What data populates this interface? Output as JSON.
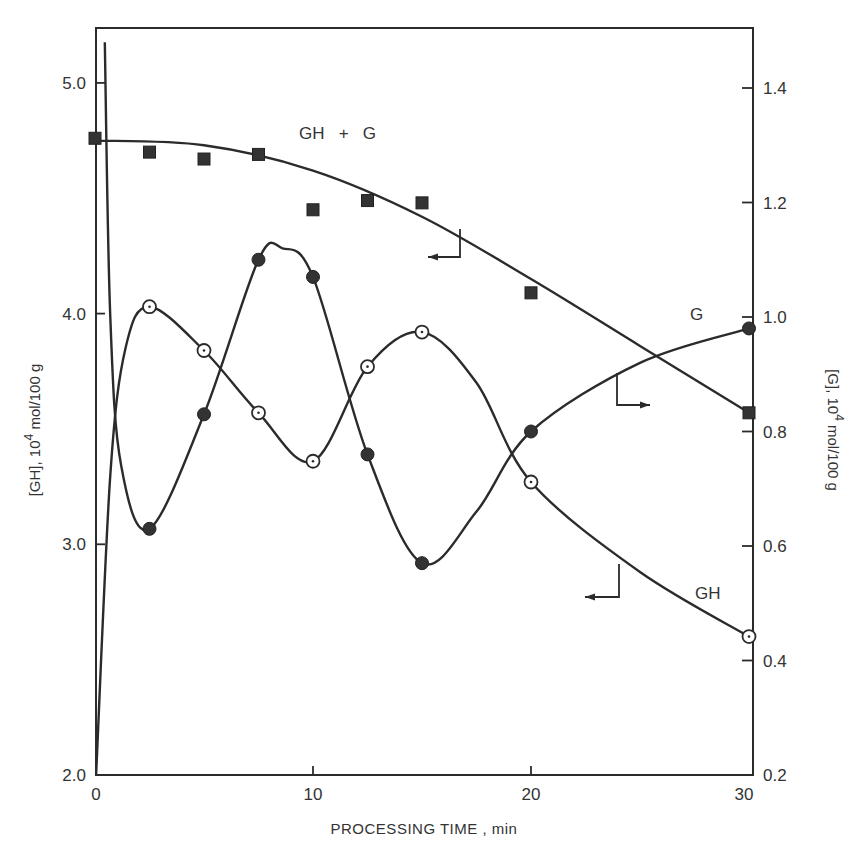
{
  "chart_data": {
    "type": "line",
    "title": "",
    "xlabel": "PROCESSING  TIME , min",
    "ylabel_left": "[GH], 10^4 mol/100 g",
    "ylabel_right": "[G], 10^4 mol/100 g",
    "xlim": [
      0,
      30
    ],
    "ylim_left": [
      2.0,
      5.25
    ],
    "ylim_right": [
      0.2,
      1.5
    ],
    "x_ticks": [
      0,
      10,
      20,
      30
    ],
    "y_ticks_left": [
      "2.0",
      "3.0",
      "4.0",
      "5.0"
    ],
    "y_ticks_right": [
      "0.2",
      "0.4",
      "0.6",
      "0.8",
      "1.0",
      "1.2",
      "1.4"
    ],
    "grid": false,
    "legend": "inline labels",
    "series": [
      {
        "name": "GH + G",
        "axis": "left",
        "marker": "filled-square",
        "x": [
          0,
          2.5,
          5,
          7.5,
          10,
          12.5,
          15,
          20,
          30
        ],
        "values": [
          4.76,
          4.7,
          4.67,
          4.69,
          4.45,
          4.49,
          4.48,
          4.09,
          3.57
        ],
        "curve": [
          [
            0,
            4.75
          ],
          [
            5,
            4.73
          ],
          [
            10,
            4.62
          ],
          [
            15,
            4.42
          ],
          [
            20,
            4.15
          ],
          [
            25,
            3.86
          ],
          [
            30,
            3.57
          ]
        ]
      },
      {
        "name": "GH",
        "axis": "left",
        "marker": "open-circle-dot",
        "x": [
          2.5,
          5,
          7.5,
          10,
          12.5,
          15,
          20,
          30
        ],
        "values": [
          4.03,
          3.84,
          3.57,
          3.36,
          3.77,
          3.92,
          3.27,
          2.6
        ],
        "curve": [
          [
            0.05,
            2.0
          ],
          [
            0.7,
            3.3
          ],
          [
            1.4,
            3.85
          ],
          [
            2.5,
            4.03
          ],
          [
            5,
            3.84
          ],
          [
            7.5,
            3.57
          ],
          [
            10,
            3.36
          ],
          [
            12.5,
            3.77
          ],
          [
            15,
            3.92
          ],
          [
            17.5,
            3.7
          ],
          [
            20,
            3.27
          ],
          [
            25,
            2.88
          ],
          [
            30,
            2.6
          ]
        ]
      },
      {
        "name": "G",
        "axis": "right",
        "marker": "filled-circle",
        "x": [
          2.5,
          5,
          7.5,
          10,
          12.5,
          15,
          20,
          30
        ],
        "values": [
          0.63,
          0.83,
          1.1,
          1.07,
          0.76,
          0.57,
          0.8,
          0.98
        ],
        "curve": [
          [
            0.45,
            1.48
          ],
          [
            0.7,
            1.0
          ],
          [
            1.2,
            0.74
          ],
          [
            2.5,
            0.63
          ],
          [
            5,
            0.83
          ],
          [
            7.5,
            1.1
          ],
          [
            8.6,
            1.12
          ],
          [
            10,
            1.07
          ],
          [
            12.5,
            0.76
          ],
          [
            15,
            0.57
          ],
          [
            17.5,
            0.66
          ],
          [
            20,
            0.8
          ],
          [
            25,
            0.92
          ],
          [
            30,
            0.98
          ]
        ]
      }
    ],
    "annotations": [
      {
        "text": "GH + G",
        "x": 299,
        "y": 139
      },
      {
        "text": "G",
        "x": 690,
        "y": 320
      },
      {
        "text": "GH",
        "x": 695,
        "y": 599
      }
    ],
    "axis_arrows": [
      {
        "series": "GH + G",
        "direction": "left",
        "from": [
          460,
          229
        ],
        "corner": [
          460,
          257
        ],
        "to": [
          428,
          257
        ]
      },
      {
        "series": "G",
        "direction": "right",
        "from": [
          617,
          373
        ],
        "corner": [
          617,
          405
        ],
        "to": [
          650,
          405
        ]
      },
      {
        "series": "GH",
        "direction": "left",
        "from": [
          619,
          564
        ],
        "corner": [
          619,
          597
        ],
        "to": [
          585,
          597
        ]
      }
    ]
  },
  "colors": {
    "ink": "#2b2b2b",
    "background": "#ffffff"
  }
}
